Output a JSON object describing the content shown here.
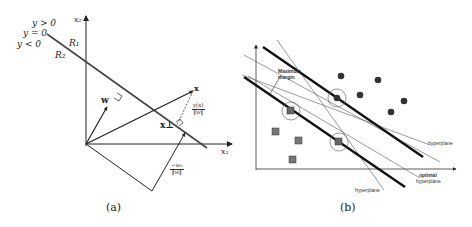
{
  "panel_a": {
    "caption": "(a)",
    "labels": {
      "y_gt": "y > 0",
      "y_eq": "y = 0",
      "y_lt": "y < 0",
      "region1": "R₁",
      "region2": "R₂",
      "axis_x2": "x₂",
      "axis_x1": "x₁",
      "vec_w": "w",
      "vec_x": "x",
      "x_perp": "x⊥",
      "dist_num": "y(x)",
      "dist_den": "‖w‖",
      "bias_num": "−w₀",
      "bias_den": "‖w‖"
    }
  },
  "panel_b": {
    "caption": "(b)",
    "labels": {
      "max_margin_line1": "Maximum",
      "max_margin_line2": "margin",
      "hyperplane_right": "hyperplane",
      "hyperplane_bottom": "hyperplane",
      "optimal_line1": "optimal",
      "optimal_line2": "hyperplane"
    },
    "circles_points": [
      {
        "x": 345,
        "y": 65
      },
      {
        "x": 365,
        "y": 77
      },
      {
        "x": 399,
        "y": 75
      },
      {
        "x": 404,
        "y": 101
      },
      {
        "x": 391,
        "y": 112
      },
      {
        "x": 337,
        "y": 98
      }
    ],
    "square_points": [
      {
        "x": 291,
        "y": 111
      },
      {
        "x": 276,
        "y": 131
      },
      {
        "x": 299,
        "y": 141
      },
      {
        "x": 293,
        "y": 160
      },
      {
        "x": 339,
        "y": 142
      }
    ],
    "support_vectors": [
      {
        "x": 337,
        "y": 98
      },
      {
        "x": 291,
        "y": 111
      },
      {
        "x": 339,
        "y": 142
      }
    ]
  }
}
